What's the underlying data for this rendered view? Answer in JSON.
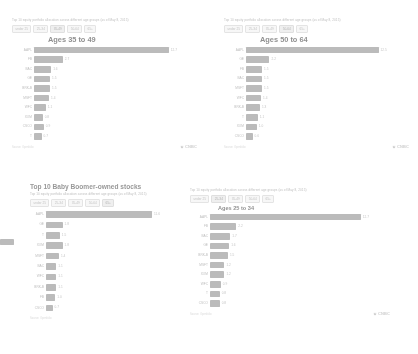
{
  "branding": {
    "logo_text": "CNBC",
    "logo_icon": "cnbc-peacock-icon"
  },
  "common": {
    "subtitle": "Top 10 equity portfolio allocation across different age groups (as of May 8, 2015)",
    "source": "Source: Openfolio",
    "age_tabs": [
      "under 25",
      "25-34",
      "35-49",
      "50-64",
      "65+"
    ]
  },
  "panels": [
    {
      "id": "panel-a",
      "subtitle": "Top 10 equity portfolio allocation across different age groups (as of May 8, 2015)",
      "tabs": [
        "under 25",
        "25-34",
        "35-49",
        "50-64",
        "65+"
      ],
      "active_tab": "35-49",
      "title": "Ages  35 to 49",
      "source": "Source: Openfolio",
      "chart_data": {
        "type": "bar",
        "orientation": "horizontal",
        "title": "Ages  35 to 49",
        "xlabel": "",
        "ylabel": "",
        "categories": [
          "AAPL",
          "FB",
          "BAC",
          "GE",
          "BRK-B",
          "MSFT",
          "WFC",
          "XOM",
          "CSCO",
          "T"
        ],
        "values": [
          12.7,
          2.7,
          1.6,
          1.5,
          1.5,
          1.4,
          1.1,
          0.8,
          0.9,
          0.7
        ],
        "xlim": [
          0,
          13.5
        ],
        "grid": false,
        "legend": "none"
      }
    },
    {
      "id": "panel-b",
      "subtitle": "Top 10 equity portfolio allocation across different age groups (as of May 8, 2015)",
      "tabs": [
        "under 25",
        "25-34",
        "35-49",
        "50-64",
        "65+"
      ],
      "active_tab": "50-64",
      "title": "Ages  50 to 64",
      "source": "Source: Openfolio",
      "chart_data": {
        "type": "bar",
        "orientation": "horizontal",
        "title": "Ages  50 to 64",
        "xlabel": "",
        "ylabel": "",
        "categories": [
          "AAPL",
          "GE",
          "FB",
          "BAC",
          "MSFT",
          "WFC",
          "BRK-B",
          "T",
          "XOM",
          "CSCO"
        ],
        "values": [
          12.5,
          2.2,
          1.5,
          1.5,
          1.5,
          1.4,
          1.3,
          1.1,
          1.0,
          0.6
        ],
        "xlim": [
          0,
          13.5
        ],
        "grid": false,
        "legend": "none"
      }
    },
    {
      "id": "panel-c",
      "big_title": "Top 10 Baby Boomer-owned stocks",
      "subtitle": "Top 10 equity portfolio allocation across different age groups (as of May 8, 2015)",
      "tabs": [
        "under 25",
        "25-34",
        "35-49",
        "50-64",
        "65+"
      ],
      "active_tab": "65+",
      "source": "Source: Openfolio",
      "chart_data": {
        "type": "bar",
        "orientation": "horizontal",
        "title": "Top 10 Baby Boomer-owned stocks",
        "xlabel": "",
        "ylabel": "",
        "categories": [
          "AAPL",
          "GE",
          "T",
          "XOM",
          "MSFT",
          "BAC",
          "WFC",
          "BRK-B",
          "FB",
          "CSCO"
        ],
        "values": [
          11.6,
          1.8,
          1.5,
          1.8,
          1.4,
          1.1,
          1.1,
          1.1,
          1.0,
          0.7
        ],
        "xlim": [
          0,
          12.5
        ],
        "grid": false,
        "legend": "none"
      }
    },
    {
      "id": "panel-d",
      "subtitle": "Top 10 equity portfolio allocation across different age groups (as of May 8, 2015)",
      "tabs": [
        "under 25",
        "25-34",
        "35-49",
        "50-64",
        "65+"
      ],
      "active_tab": "25-34",
      "title": "Ages 25 to 34",
      "source": "Source: Openfolio",
      "chart_data": {
        "type": "bar",
        "orientation": "horizontal",
        "title": "Ages 25 to 34",
        "xlabel": "",
        "ylabel": "",
        "categories": [
          "AAPL",
          "FB",
          "BAC",
          "GE",
          "BRK-B",
          "MSFT",
          "XOM",
          "WFC",
          "T",
          "CSCO"
        ],
        "values": [
          12.7,
          2.2,
          1.7,
          1.6,
          1.5,
          1.2,
          1.2,
          0.9,
          0.8,
          0.8
        ],
        "xlim": [
          0,
          13.5
        ],
        "grid": false,
        "legend": "none"
      }
    }
  ],
  "colors": {
    "bar": "#8d8d8d",
    "tab_active_bg": "#ededed",
    "text_muted": "#9a9a9a",
    "title": "#3a3a3a"
  }
}
